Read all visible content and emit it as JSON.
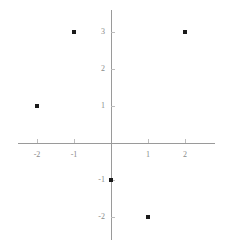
{
  "chart_data": {
    "type": "scatter",
    "title": "",
    "xlabel": "",
    "ylabel": "",
    "x": [
      -1,
      2,
      -2,
      0,
      1
    ],
    "y": [
      3,
      3,
      1,
      -1,
      -2
    ],
    "points": [
      {
        "x": -1,
        "y": 3
      },
      {
        "x": 2,
        "y": 3
      },
      {
        "x": -2,
        "y": 1
      },
      {
        "x": 0,
        "y": -1
      },
      {
        "x": 1,
        "y": -2
      }
    ],
    "xlim": [
      -2.5,
      2.8
    ],
    "ylim": [
      -2.6,
      3.5
    ],
    "xticks": [
      -2,
      -1,
      1,
      2
    ],
    "yticks": [
      3,
      2,
      1,
      -1,
      -2
    ],
    "xtick_labels": [
      "-2",
      "-1",
      "1",
      "2"
    ],
    "ytick_labels": [
      "3",
      "2",
      "1",
      "-1",
      "-2"
    ],
    "grid": false,
    "legend": null,
    "marker": "square-dot",
    "marker_color": "#1a1a1a",
    "axis_color": "#9a9a9a",
    "tick_color": "#bdbdbd",
    "label_color": "#8a8a8a",
    "background": "#ffffff",
    "origin_px": {
      "x": 111,
      "y": 143
    },
    "unit_px": 37
  }
}
